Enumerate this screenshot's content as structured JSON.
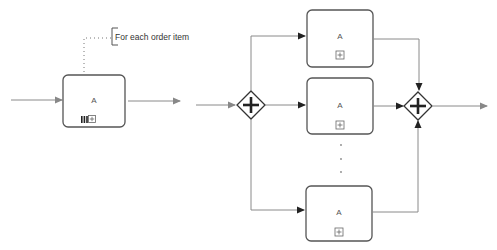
{
  "colors": {
    "flow": "#8a8a8a",
    "box_stroke": "#555555",
    "gateway_stroke": "#333333",
    "arrowhead": "#222222",
    "annotation_dots": "#777777"
  },
  "left_diagram": {
    "task": {
      "label": "A",
      "markers": [
        "multi-instance-parallel-icon",
        "subprocess-collapsed-icon"
      ]
    },
    "annotation": {
      "text": "For each order item"
    }
  },
  "right_diagram": {
    "split_gateway": {
      "type": "parallel",
      "icon": "plus-icon"
    },
    "join_gateway": {
      "type": "parallel",
      "icon": "plus-icon"
    },
    "tasks": [
      {
        "label": "A",
        "marker": "subprocess-collapsed-icon"
      },
      {
        "label": "A",
        "marker": "subprocess-collapsed-icon"
      },
      {
        "label": "A",
        "marker": "subprocess-collapsed-icon"
      }
    ],
    "ellipsis": "vertical-ellipsis"
  }
}
